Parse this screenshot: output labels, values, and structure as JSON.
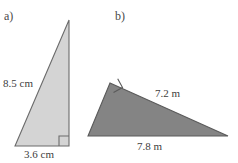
{
  "figure": {
    "background_color": "#ffffff",
    "parts": [
      {
        "key": "a",
        "label": "a)",
        "shape": "right-triangle",
        "fill_color": "#d4d4d4",
        "stroke_color": "#6b6b6b",
        "right_angle_position": "bottom-right",
        "dimensions": [
          {
            "name": "hypotenuse",
            "text": "8.5 cm",
            "value": 8.5,
            "unit": "cm"
          },
          {
            "name": "base",
            "text": "3.6 cm",
            "value": 3.6,
            "unit": "cm"
          }
        ]
      },
      {
        "key": "b",
        "label": "b)",
        "shape": "right-triangle",
        "fill_color": "#848484",
        "stroke_color": "#5a5a5a",
        "right_angle_position": "top-left",
        "dimensions": [
          {
            "name": "hypotenuse",
            "text": "7.2 m",
            "value": 7.2,
            "unit": "m"
          },
          {
            "name": "base",
            "text": "7.8 m",
            "value": 7.8,
            "unit": "m"
          }
        ]
      }
    ]
  }
}
